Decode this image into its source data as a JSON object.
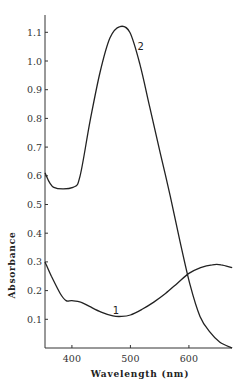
{
  "chart_data": {
    "type": "line",
    "title": "",
    "xlabel": "Wavelength (nm)",
    "ylabel": "Absorbance",
    "xlim": [
      354,
      674
    ],
    "ylim": [
      0,
      1.15
    ],
    "grid": false,
    "legend": "inline curve labels",
    "x_ticks": [
      400,
      500,
      600
    ],
    "x_tick_labels": [
      "400",
      "500",
      "600"
    ],
    "y_ticks": [
      0.1,
      0.2,
      0.3,
      0.4,
      0.5,
      0.6,
      0.7,
      0.8,
      0.9,
      1.0,
      1.1
    ],
    "y_tick_labels": [
      "0.1",
      "0.2",
      "0.3",
      "0.4",
      "0.5",
      "0.6",
      "0.7",
      "0.8",
      "0.9",
      "1.0",
      "1.1"
    ],
    "series": [
      {
        "name": "1",
        "label_position": {
          "x": 470,
          "y": 0.12
        },
        "x": [
          354,
          365,
          380,
          390,
          400,
          415,
          430,
          450,
          470,
          485,
          500,
          520,
          540,
          560,
          580,
          600,
          620,
          640,
          655,
          674
        ],
        "values": [
          0.3,
          0.25,
          0.19,
          0.165,
          0.165,
          0.16,
          0.145,
          0.125,
          0.112,
          0.11,
          0.115,
          0.135,
          0.16,
          0.19,
          0.225,
          0.26,
          0.28,
          0.29,
          0.29,
          0.28
        ]
      },
      {
        "name": "2",
        "label_position": {
          "x": 512,
          "y": 1.04
        },
        "x": [
          354,
          369,
          402,
          414,
          431,
          448,
          465,
          482,
          499,
          516,
          533,
          551,
          568,
          585,
          602,
          619,
          636,
          653,
          674
        ],
        "values": [
          0.61,
          0.56,
          0.56,
          0.6,
          0.79,
          0.96,
          1.08,
          1.12,
          1.1,
          0.99,
          0.84,
          0.68,
          0.53,
          0.37,
          0.22,
          0.11,
          0.055,
          0.02,
          0.0
        ]
      }
    ]
  }
}
